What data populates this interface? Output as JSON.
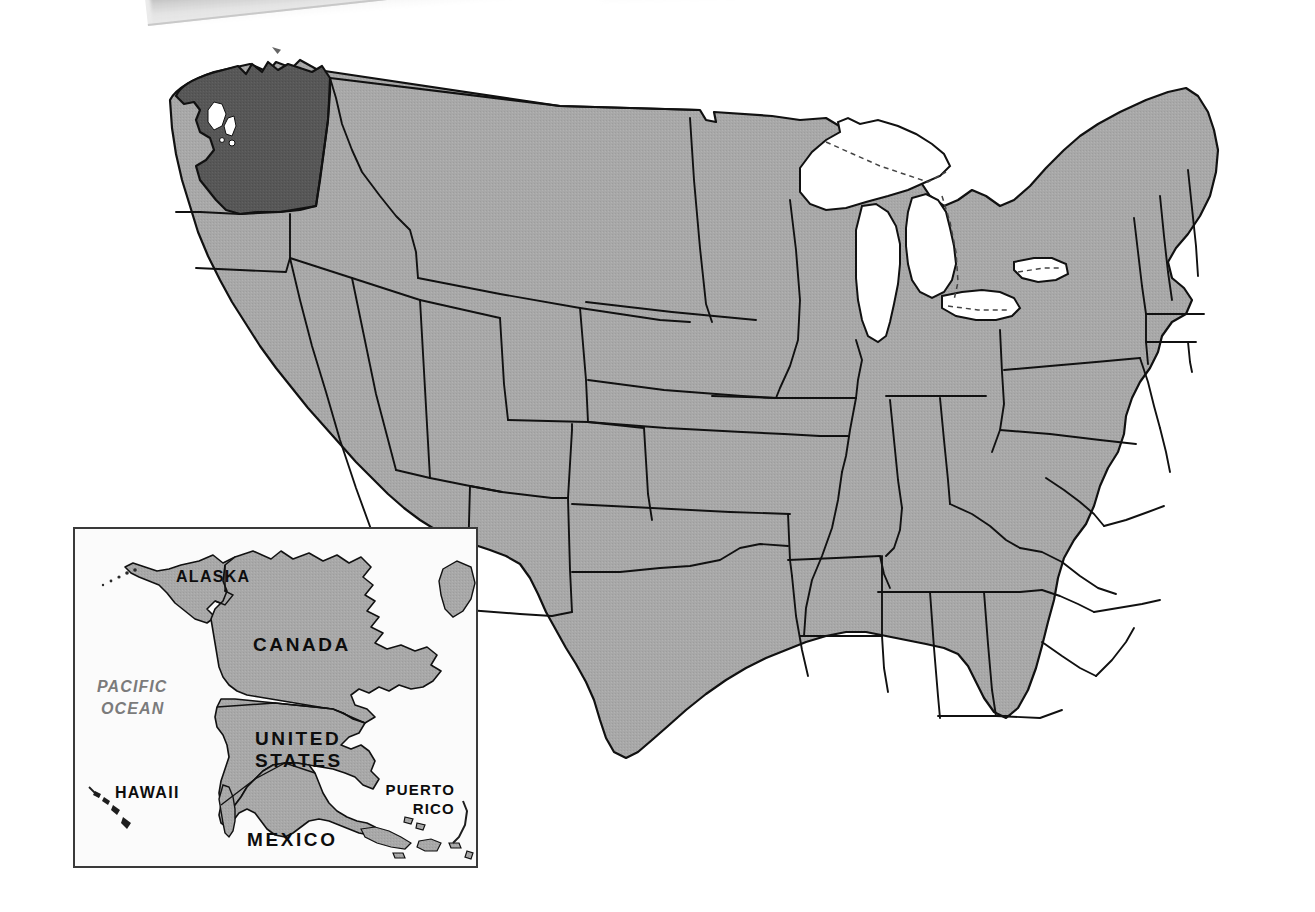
{
  "document": {
    "type": "reference-map",
    "title": "United States reference map with Washington highlighted",
    "background_color": "#ffffff"
  },
  "scan_artifact": {
    "present": true,
    "name": "page-edge-shadow",
    "description": "diagonal scanned page edge with drop shadow across the top-left of the image",
    "paper_color": "#ebebeb",
    "shadow_color": "#787878"
  },
  "main_map": {
    "name": "united-states-map",
    "projection": "albers-like",
    "land_fill": "#a8a8a8",
    "highlight_fill": "#575757",
    "water_fill": "#ffffff",
    "border_color": "#111111",
    "lake_border_style": "dashed",
    "highlighted_state": "Washington",
    "features": {
      "great_lakes": [
        "Superior",
        "Michigan",
        "Huron",
        "Erie",
        "Ontario"
      ],
      "shows_state_boundaries": true,
      "shows_labels": false
    }
  },
  "inset": {
    "name": "north-america-locator-inset",
    "background_color": "#fbfbfb",
    "border_color": "#3a3a3a",
    "land_fill": "#a8a8a8",
    "labels": [
      {
        "id": "alaska",
        "text": "ALASKA",
        "style": "small"
      },
      {
        "id": "canada",
        "text": "CANADA",
        "style": "major"
      },
      {
        "id": "pacific-ocean",
        "text": "PACIFIC\nOCEAN",
        "style": "ocean"
      },
      {
        "id": "united-states",
        "text": "UNITED\nSTATES",
        "style": "major"
      },
      {
        "id": "hawaii",
        "text": "HAWAII",
        "style": "small"
      },
      {
        "id": "mexico",
        "text": "MEXICO",
        "style": "major"
      },
      {
        "id": "puerto-rico",
        "text": "PUERTO\nRICO",
        "style": "puerto-rico"
      }
    ],
    "label_text": {
      "alaska": "ALASKA",
      "canada": "CANADA",
      "pacific_ocean_line1": "PACIFIC",
      "pacific_ocean_line2": "OCEAN",
      "united_states_line1": "UNITED",
      "united_states_line2": "STATES",
      "hawaii": "HAWAII",
      "mexico": "MEXICO",
      "puerto_rico_line1": "PUERTO",
      "puerto_rico_line2": "RICO"
    }
  },
  "colors": {
    "land": "#a8a8a8",
    "highlight": "#575757",
    "outline": "#111111",
    "ocean_label": "#7b7b7b",
    "paper": "#ffffff"
  }
}
